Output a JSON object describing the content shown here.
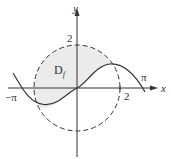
{
  "figure": {
    "axes": {
      "x_label": "x",
      "y_label": "y"
    },
    "tick_labels": {
      "y_two": "2",
      "x_two": "2",
      "neg_pi": "−π",
      "pi": "π"
    },
    "region_label": {
      "main": "D",
      "sub": "f"
    },
    "elements": {
      "circle": "dashed circle of radius 2 centered at origin",
      "curve": "sine curve y = sin(x) from -pi to pi",
      "shaded_region": "part of disk above the sine curve"
    },
    "colors": {
      "line": "#333333",
      "shade": "#ebebeb"
    }
  }
}
